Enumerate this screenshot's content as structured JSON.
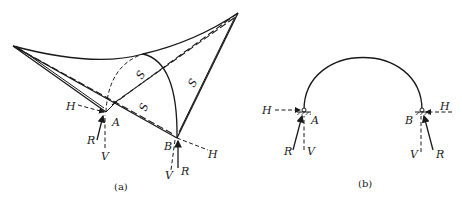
{
  "figure_a": {
    "caption": "(a)",
    "labels": {
      "A": "A",
      "B": "B",
      "H_left": "H",
      "H_right": "H",
      "R_left": "R",
      "R_right": "R",
      "V_left": "V",
      "V_right": "V",
      "S1": "S",
      "S2": "S",
      "S3": "S"
    }
  },
  "figure_b": {
    "caption": "(b)",
    "labels": {
      "A": "A",
      "B": "B",
      "H_left": "H",
      "H_right": "H",
      "R_left": "R",
      "R_right": "R",
      "V_left": "V",
      "V_right": "V"
    }
  }
}
